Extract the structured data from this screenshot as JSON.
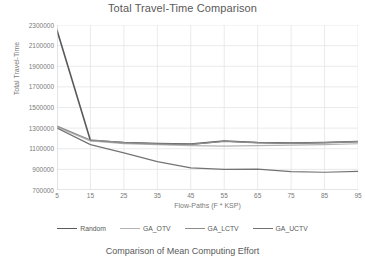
{
  "chart_data": {
    "type": "line",
    "title": "Total Travel-Time Comparison",
    "xlabel": "Flow-Paths (F * KSP)",
    "ylabel": "Total Travel-Time",
    "x": [
      5,
      15,
      25,
      35,
      45,
      55,
      65,
      75,
      85,
      95
    ],
    "xticklabels": [
      "5",
      "15",
      "25",
      "35",
      "45",
      "55",
      "65",
      "75",
      "85",
      "95"
    ],
    "yticklabels": [
      "700000",
      "900000",
      "1100000",
      "1300000",
      "1500000",
      "1700000",
      "1900000",
      "2100000",
      "2300000"
    ],
    "yticks": [
      700000,
      900000,
      1100000,
      1300000,
      1500000,
      1700000,
      1900000,
      2100000,
      2300000
    ],
    "xlim": [
      5,
      95
    ],
    "ylim": [
      700000,
      2300000
    ],
    "grid": true,
    "legend_position": "bottom",
    "series": [
      {
        "name": "Random",
        "color": "#595959",
        "width": 1.6,
        "values": [
          2250000,
          1180000,
          1160000,
          1150000,
          1145000,
          1175000,
          1160000,
          1155000,
          1160000,
          1170000
        ]
      },
      {
        "name": "GA_OTV",
        "color": "#b3b3b3",
        "width": 1.1,
        "values": [
          1310000,
          1175000,
          1150000,
          1140000,
          1130000,
          1125000,
          1130000,
          1135000,
          1140000,
          1148000
        ]
      },
      {
        "name": "GA_LCTV",
        "color": "#8c8c8c",
        "width": 1.3,
        "values": [
          1320000,
          1185000,
          1158000,
          1148000,
          1142000,
          1172000,
          1158000,
          1152000,
          1158000,
          1168000
        ]
      },
      {
        "name": "GA_UCTV",
        "color": "#737373",
        "width": 1.2,
        "values": [
          1300000,
          1140000,
          1060000,
          975000,
          915000,
          900000,
          902000,
          878000,
          872000,
          880000
        ]
      }
    ]
  },
  "caption": "Comparison of Mean  Computing Effort"
}
